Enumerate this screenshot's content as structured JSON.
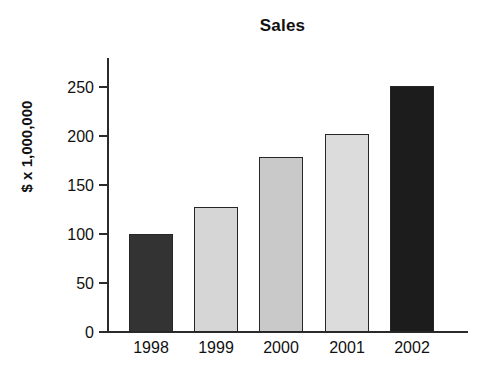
{
  "chart_data": {
    "type": "bar",
    "title": "Sales",
    "xlabel": "",
    "ylabel": "$ x 1,000,000",
    "categories": [
      "1998",
      "1999",
      "2000",
      "2001",
      "2002"
    ],
    "values": [
      100,
      127,
      178,
      201,
      250
    ],
    "ylim": [
      0,
      250
    ],
    "yticks": [
      0,
      50,
      100,
      150,
      200,
      250
    ],
    "ytick_labels": [
      "0",
      "50",
      "100",
      "150",
      "200",
      "250"
    ],
    "grid": false,
    "legend": null,
    "bar_colors": [
      "#333333",
      "#d6d6d6",
      "#c9c9c9",
      "#dcdcdc",
      "#1c1c1c"
    ],
    "bar_edge_color": "#262626",
    "axis_color": "#2b2b2b",
    "background_color": "#ffffff"
  },
  "axis": {
    "y_title": "$ x 1,000,000"
  }
}
